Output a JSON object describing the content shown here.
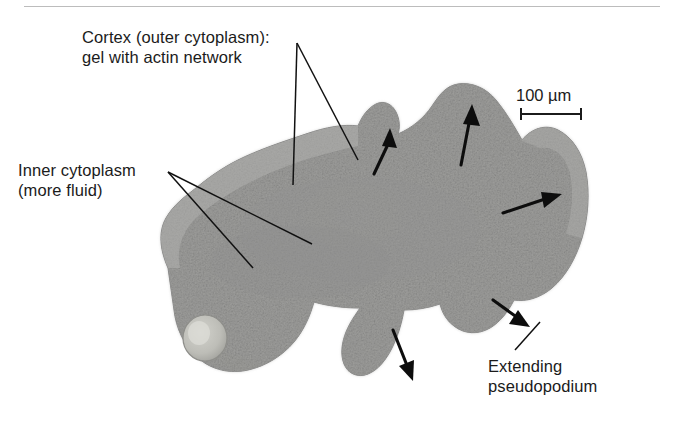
{
  "figure": {
    "background_color": "#ffffff",
    "rule_color": "#bcbcbc"
  },
  "labels": {
    "cortex": "Cortex (outer cytoplasm):\ngel with actin network",
    "inner_cytoplasm": "Inner cytoplasm\n(more fluid)",
    "extending_pseudopodium": "Extending\npseudopodium"
  },
  "scalebar": {
    "value": "100",
    "unit": "µm",
    "text": "100 µm",
    "length_px": 60
  },
  "specimen": {
    "name": "amoeba-cell",
    "cytoplasm_color": "#9b9b9b",
    "cortex_color": "#b0b0b0",
    "vacuole_color": "#c9c9c4",
    "outline_color": "#8a8a8a"
  },
  "annotations": {
    "arrow_count": 5,
    "arrow_color": "#0d0d0d",
    "leader_color": "#111111",
    "arrows": [
      {
        "name": "arrow-pseudopod-small-up",
        "direction": "up"
      },
      {
        "name": "arrow-pseudopod-large-up",
        "direction": "up"
      },
      {
        "name": "arrow-right-extending",
        "direction": "right"
      },
      {
        "name": "arrow-lower-right-down",
        "direction": "down-right"
      },
      {
        "name": "arrow-bottom-retracting",
        "direction": "down-right"
      }
    ]
  }
}
